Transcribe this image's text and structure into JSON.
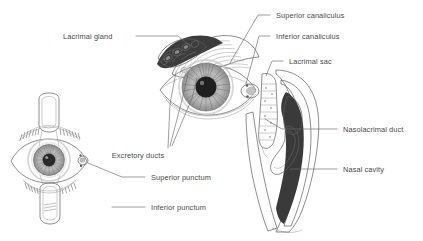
{
  "figure": {
    "background_color": "#ffffff",
    "label_color": "#4a4a4a",
    "leader_color": "#6b6b6b",
    "ink_dark": "#3a3a3a",
    "ink_mid": "#9a9a9a",
    "ink_light": "#d8d8d8"
  },
  "labels": {
    "lacrimal_gland": "Lacrimal gland",
    "superior_canaliculus": "Superior canaliculus",
    "inferior_canaliculus": "Inferior canaliculus",
    "lacrimal_sac": "Lacrimal sac",
    "nasolacrimal_duct": "Nasolacrimal duct",
    "nasal_cavity": "Nasal cavity",
    "excretory_ducts": "Excretory ducts",
    "superior_punctum": "Superior punctum",
    "inferior_punctum": "Inferior punctum"
  },
  "panels": [
    {
      "name": "anterior-eye-everted-lids",
      "position": "lower-left",
      "structures": [
        "everted upper eyelid",
        "everted lower eyelid",
        "cornea",
        "iris",
        "pupil",
        "sclera",
        "eyelashes",
        "superior punctum",
        "inferior punctum",
        "meibomian gland striations"
      ]
    },
    {
      "name": "anterior-orbit-lacrimal-gland",
      "position": "upper-center",
      "structures": [
        "lacrimal gland",
        "excretory ducts",
        "upper eyelid",
        "iris",
        "pupil",
        "lacrimal sac",
        "medial canthus",
        "caruncle"
      ]
    },
    {
      "name": "nasal-sagittal-section",
      "position": "right",
      "structures": [
        "lacrimal sac",
        "nasolacrimal duct",
        "nasal cavity",
        "inferior turbinate",
        "nasal mucosa",
        "maxillary bone"
      ]
    }
  ]
}
